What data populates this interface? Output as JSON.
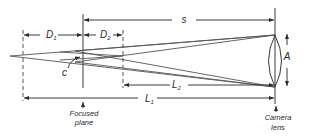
{
  "diagram": {
    "type": "depth-of-field optical diagram",
    "labels": {
      "D1": "D",
      "D1_sub": "1",
      "D2": "D",
      "D2_sub": "2",
      "s": "s",
      "A": "A",
      "c": "c",
      "L1": "L",
      "L1_sub": "1",
      "L2": "L",
      "L2_sub": "2"
    },
    "captions": {
      "focused_plane_line1": "Focused",
      "focused_plane_line2": "plane",
      "camera_lens_line1": "Camera",
      "camera_lens_line2": "lens"
    },
    "colors": {
      "line": "#3a3a3a",
      "background": "#ffffff"
    }
  }
}
